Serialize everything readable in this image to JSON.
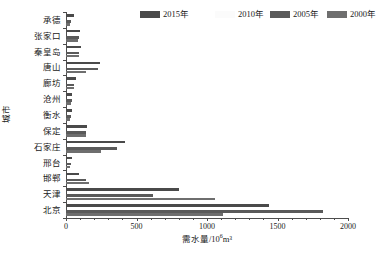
{
  "chart_data": {
    "type": "bar",
    "orientation": "horizontal",
    "title": "",
    "xlabel": "需水量/10⁶m³",
    "ylabel": "城市",
    "xlim": [
      0,
      2000
    ],
    "xticks": [
      0,
      500,
      1000,
      1500,
      2000
    ],
    "xtick_labels": [
      "0",
      "500",
      "1000",
      "1500",
      "2000"
    ],
    "grid": false,
    "legend_position": "top",
    "categories": [
      "承德",
      "张家口",
      "秦皇岛",
      "唐山",
      "廊坊",
      "沧州",
      "衡水",
      "保定",
      "石家庄",
      "邢台",
      "邯郸",
      "天津",
      "北京"
    ],
    "series": [
      {
        "name": "2015年",
        "color": "#4a4a4a",
        "values": [
          55,
          100,
          105,
          240,
          70,
          45,
          40,
          150,
          420,
          40,
          95,
          800,
          1440
        ]
      },
      {
        "name": "2010年",
        "color": "#f2f2f2",
        "values": [
          0,
          0,
          0,
          0,
          0,
          0,
          0,
          0,
          0,
          0,
          0,
          0,
          0
        ]
      },
      {
        "name": "2005年",
        "color": "#5a5a5a",
        "values": [
          35,
          90,
          95,
          230,
          60,
          40,
          35,
          145,
          360,
          35,
          145,
          620,
          1820
        ]
      },
      {
        "name": "2000年",
        "color": "#6e6e6e",
        "values": [
          30,
          85,
          90,
          140,
          55,
          35,
          30,
          140,
          250,
          30,
          165,
          1060,
          1110
        ]
      }
    ]
  },
  "legend": {
    "items": [
      {
        "label": "2015年",
        "color": "#4a4a4a"
      },
      {
        "label": "2010年",
        "color": "#fbfbfb"
      },
      {
        "label": "2005年",
        "color": "#5a5a5a"
      },
      {
        "label": "2000年",
        "color": "#6e6e6e"
      }
    ]
  },
  "axes": {
    "x_title": "需水量/10⁶m³",
    "x_title_base": "需水量/10",
    "x_title_sup": "6",
    "x_title_tail": "m³",
    "y_title": "城市"
  }
}
